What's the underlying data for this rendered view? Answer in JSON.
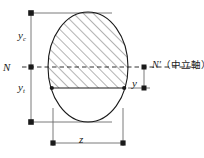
{
  "figure": {
    "type": "engineering-cross-section-diagram",
    "background_color": "#ffffff",
    "line_color": "#1a1a1a",
    "dimension_line_color": "#6b6b6b",
    "hatch_color": "#4a4a4a"
  },
  "labels": {
    "y_compression": {
      "symbol": "y",
      "subscript": "c"
    },
    "y_tension": {
      "symbol": "y",
      "subscript": "t"
    },
    "neutral_axis_left": "N",
    "neutral_axis_right_symbol": "N′",
    "neutral_axis_right_note": "（中立軸）",
    "small_y": "y",
    "width_z": "z"
  },
  "geometry": {
    "ellipse_center_x": 88,
    "ellipse_center_y": 67,
    "ellipse_rx": 40,
    "ellipse_ry": 55,
    "neutral_axis_y": 67,
    "hatch_bottom_y": 88,
    "left_dim_x": 31,
    "bottom_dim_y": 143,
    "z_left_x": 53,
    "z_right_x": 123
  }
}
